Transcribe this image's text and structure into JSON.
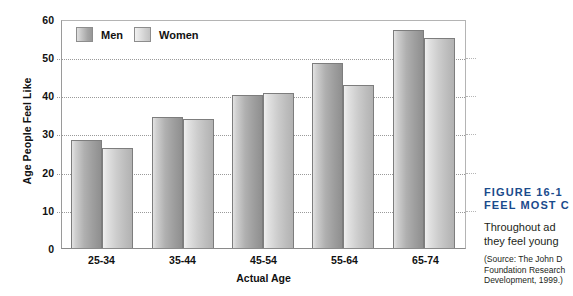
{
  "chart_data": {
    "type": "bar",
    "title": "",
    "xlabel": "Actual Age",
    "ylabel": "Age People Feel Like",
    "categories": [
      "25-34",
      "35-44",
      "45-54",
      "55-64",
      "65-74"
    ],
    "series": [
      {
        "name": "Men",
        "values": [
          28.5,
          34.5,
          40.5,
          49.0,
          57.5
        ],
        "color": "#a8a8a8"
      },
      {
        "name": "Women",
        "values": [
          26.5,
          34.0,
          41.0,
          43.0,
          55.5
        ],
        "color": "#d2d2d2"
      }
    ],
    "ylim": [
      0,
      60
    ],
    "yticks": [
      0,
      10,
      20,
      30,
      40,
      50,
      60
    ],
    "ytick_labels": [
      "0",
      "10",
      "20",
      "30",
      "40",
      "50",
      "60"
    ],
    "grid": "horizontal-dotted",
    "legend_position": "top-left-inside"
  },
  "legend": {
    "entries": [
      {
        "label": "Men"
      },
      {
        "label": "Women"
      }
    ]
  },
  "caption": {
    "figure_label": "FIGURE 16-1",
    "title_line2": "FEEL MOST C",
    "body_line1": "Throughout  ad",
    "body_line2": "they feel young",
    "source_line1": "(Source: The John D",
    "source_line2": "Foundation Research",
    "source_line3": "Development, 1999.)"
  }
}
